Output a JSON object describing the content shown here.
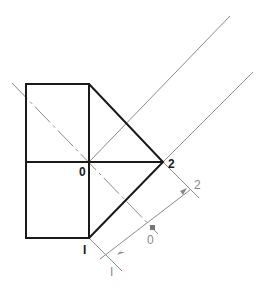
{
  "diagram": {
    "labels": {
      "origin": "0",
      "point2": "2",
      "point1": "I",
      "axis_0": "0",
      "axis_2": "2",
      "axis_1": "I"
    },
    "colors": {
      "primary": "#1a1a1a",
      "secondary": "#8a8a8a"
    }
  }
}
